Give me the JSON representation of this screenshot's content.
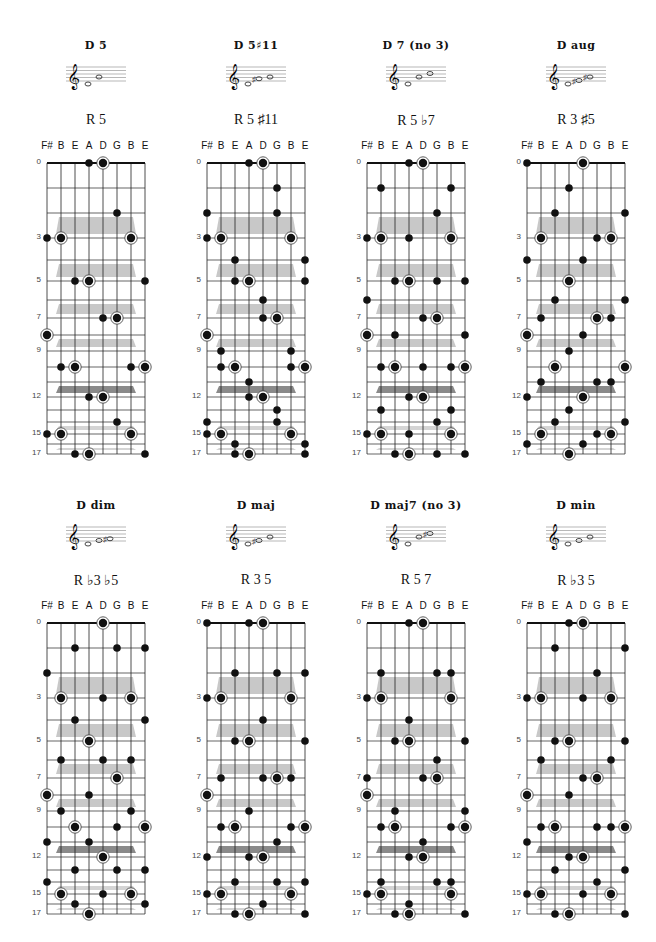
{
  "page": {
    "string_labels": [
      "F#",
      "B",
      "E",
      "A",
      "D",
      "G",
      "B",
      "E"
    ],
    "fret_labels": [
      0,
      3,
      5,
      7,
      9,
      12,
      15,
      17
    ],
    "inlay_bands": [
      {
        "between": [
          2,
          3
        ],
        "shade": "#c8c8c8"
      },
      {
        "between": [
          4,
          5
        ],
        "shade": "#c8c8c8"
      },
      {
        "between": [
          6,
          7
        ],
        "shade": "#c8c8c8"
      },
      {
        "between": [
          8,
          9
        ],
        "shade": "#c8c8c8"
      },
      {
        "between": [
          11,
          12
        ],
        "shade": "#8a8a8a"
      },
      {
        "between": [
          14,
          15
        ],
        "shade": "#d4d4d4"
      },
      {
        "between": [
          16,
          17
        ],
        "shade": "#d4d4d4"
      }
    ],
    "colors": {
      "dot": "#111111",
      "grid": "#222222",
      "nut": "#111111"
    }
  },
  "charts": [
    {
      "title": "D 5",
      "formula": "R 5",
      "staff_notes": [
        "D",
        "A"
      ],
      "dots": [
        [
          3,
          0,
          0
        ],
        [
          4,
          0,
          1
        ],
        [
          5,
          2,
          0
        ],
        [
          0,
          3,
          0
        ],
        [
          1,
          3,
          1
        ],
        [
          6,
          3,
          1
        ],
        [
          2,
          5,
          0
        ],
        [
          3,
          5,
          1
        ],
        [
          7,
          5,
          0
        ],
        [
          4,
          7,
          0
        ],
        [
          5,
          7,
          1
        ],
        [
          0,
          8,
          1
        ],
        [
          1,
          10,
          0
        ],
        [
          2,
          10,
          1
        ],
        [
          6,
          10,
          0
        ],
        [
          7,
          10,
          1
        ],
        [
          3,
          12,
          0
        ],
        [
          4,
          12,
          1
        ],
        [
          5,
          14,
          0
        ],
        [
          0,
          15,
          0
        ],
        [
          1,
          15,
          1
        ],
        [
          6,
          15,
          1
        ],
        [
          2,
          17,
          0
        ],
        [
          3,
          17,
          1
        ],
        [
          7,
          17,
          0
        ]
      ]
    },
    {
      "title": "D 5♯11",
      "formula": "R 5 ♯11",
      "staff_notes": [
        "D",
        "G#",
        "A"
      ],
      "dots": [
        [
          3,
          0,
          0
        ],
        [
          4,
          0,
          1
        ],
        [
          5,
          1,
          0
        ],
        [
          0,
          2,
          0
        ],
        [
          5,
          2,
          0
        ],
        [
          0,
          3,
          0
        ],
        [
          1,
          3,
          1
        ],
        [
          6,
          3,
          1
        ],
        [
          2,
          4,
          0
        ],
        [
          7,
          4,
          0
        ],
        [
          2,
          5,
          0
        ],
        [
          3,
          5,
          1
        ],
        [
          7,
          5,
          0
        ],
        [
          4,
          6,
          0
        ],
        [
          4,
          7,
          0
        ],
        [
          5,
          7,
          1
        ],
        [
          0,
          8,
          1
        ],
        [
          1,
          9,
          0
        ],
        [
          6,
          9,
          0
        ],
        [
          1,
          10,
          0
        ],
        [
          2,
          10,
          1
        ],
        [
          6,
          10,
          0
        ],
        [
          7,
          10,
          1
        ],
        [
          3,
          11,
          0
        ],
        [
          3,
          12,
          0
        ],
        [
          4,
          12,
          1
        ],
        [
          5,
          13,
          0
        ],
        [
          0,
          14,
          0
        ],
        [
          5,
          14,
          0
        ],
        [
          0,
          15,
          0
        ],
        [
          1,
          15,
          1
        ],
        [
          6,
          15,
          1
        ],
        [
          2,
          16,
          0
        ],
        [
          7,
          16,
          0
        ],
        [
          2,
          17,
          0
        ],
        [
          3,
          17,
          1
        ],
        [
          7,
          17,
          0
        ]
      ]
    },
    {
      "title": "D 7 (no 3)",
      "formula": "R 5 ♭7",
      "staff_notes": [
        "D",
        "A",
        "C"
      ],
      "dots": [
        [
          3,
          0,
          0
        ],
        [
          4,
          0,
          1
        ],
        [
          1,
          1,
          0
        ],
        [
          6,
          1,
          0
        ],
        [
          5,
          2,
          0
        ],
        [
          0,
          3,
          0
        ],
        [
          1,
          3,
          1
        ],
        [
          3,
          3,
          0
        ],
        [
          6,
          3,
          1
        ],
        [
          2,
          5,
          0
        ],
        [
          3,
          5,
          1
        ],
        [
          5,
          5,
          0
        ],
        [
          7,
          5,
          0
        ],
        [
          0,
          6,
          0
        ],
        [
          4,
          7,
          0
        ],
        [
          5,
          7,
          1
        ],
        [
          0,
          8,
          1
        ],
        [
          2,
          8,
          0
        ],
        [
          7,
          8,
          0
        ],
        [
          1,
          10,
          0
        ],
        [
          2,
          10,
          1
        ],
        [
          4,
          10,
          0
        ],
        [
          6,
          10,
          0
        ],
        [
          7,
          10,
          1
        ],
        [
          3,
          12,
          0
        ],
        [
          4,
          12,
          1
        ],
        [
          1,
          13,
          0
        ],
        [
          6,
          13,
          0
        ],
        [
          5,
          14,
          0
        ],
        [
          0,
          15,
          0
        ],
        [
          1,
          15,
          1
        ],
        [
          3,
          15,
          0
        ],
        [
          6,
          15,
          1
        ],
        [
          2,
          17,
          0
        ],
        [
          3,
          17,
          1
        ],
        [
          5,
          17,
          0
        ],
        [
          7,
          17,
          0
        ]
      ]
    },
    {
      "title": "D aug",
      "formula": "R 3 ♯5",
      "staff_notes": [
        "D",
        "F#",
        "A#"
      ],
      "dots": [
        [
          0,
          0,
          0
        ],
        [
          4,
          0,
          1
        ],
        [
          3,
          1,
          0
        ],
        [
          2,
          2,
          0
        ],
        [
          7,
          2,
          0
        ],
        [
          1,
          3,
          1
        ],
        [
          5,
          3,
          0
        ],
        [
          6,
          3,
          1
        ],
        [
          0,
          4,
          0
        ],
        [
          4,
          4,
          0
        ],
        [
          3,
          5,
          1
        ],
        [
          2,
          6,
          0
        ],
        [
          7,
          6,
          0
        ],
        [
          1,
          7,
          0
        ],
        [
          5,
          7,
          1
        ],
        [
          6,
          7,
          0
        ],
        [
          0,
          8,
          1
        ],
        [
          4,
          8,
          0
        ],
        [
          3,
          9,
          0
        ],
        [
          2,
          10,
          1
        ],
        [
          7,
          10,
          1
        ],
        [
          1,
          11,
          0
        ],
        [
          5,
          11,
          0
        ],
        [
          6,
          11,
          0
        ],
        [
          0,
          12,
          0
        ],
        [
          4,
          12,
          1
        ],
        [
          3,
          13,
          0
        ],
        [
          2,
          14,
          0
        ],
        [
          7,
          14,
          0
        ],
        [
          1,
          15,
          1
        ],
        [
          5,
          15,
          0
        ],
        [
          6,
          15,
          1
        ],
        [
          0,
          16,
          0
        ],
        [
          4,
          16,
          0
        ],
        [
          3,
          17,
          1
        ]
      ]
    },
    {
      "title": "D dim",
      "formula": "R ♭3 ♭5",
      "staff_notes": [
        "D",
        "F",
        "G#"
      ],
      "dots": [
        [
          4,
          0,
          1
        ],
        [
          2,
          1,
          0
        ],
        [
          5,
          1,
          0
        ],
        [
          7,
          1,
          0
        ],
        [
          0,
          2,
          0
        ],
        [
          1,
          3,
          1
        ],
        [
          4,
          3,
          0
        ],
        [
          6,
          3,
          1
        ],
        [
          2,
          4,
          0
        ],
        [
          7,
          4,
          0
        ],
        [
          3,
          5,
          1
        ],
        [
          1,
          6,
          0
        ],
        [
          4,
          6,
          0
        ],
        [
          6,
          6,
          0
        ],
        [
          5,
          7,
          1
        ],
        [
          0,
          8,
          1
        ],
        [
          3,
          8,
          0
        ],
        [
          1,
          9,
          0
        ],
        [
          6,
          9,
          0
        ],
        [
          2,
          10,
          1
        ],
        [
          5,
          10,
          0
        ],
        [
          7,
          10,
          1
        ],
        [
          0,
          11,
          0
        ],
        [
          3,
          11,
          0
        ],
        [
          4,
          12,
          1
        ],
        [
          2,
          13,
          0
        ],
        [
          5,
          13,
          0
        ],
        [
          7,
          13,
          0
        ],
        [
          0,
          14,
          0
        ],
        [
          1,
          15,
          1
        ],
        [
          4,
          15,
          0
        ],
        [
          6,
          15,
          1
        ],
        [
          2,
          16,
          0
        ],
        [
          7,
          16,
          0
        ],
        [
          3,
          17,
          1
        ]
      ]
    },
    {
      "title": "D maj",
      "formula": "R 3 5",
      "staff_notes": [
        "D",
        "F#",
        "A"
      ],
      "dots": [
        [
          0,
          0,
          0
        ],
        [
          3,
          0,
          0
        ],
        [
          4,
          0,
          1
        ],
        [
          2,
          2,
          0
        ],
        [
          5,
          2,
          0
        ],
        [
          7,
          2,
          0
        ],
        [
          0,
          3,
          0
        ],
        [
          1,
          3,
          1
        ],
        [
          6,
          3,
          1
        ],
        [
          4,
          4,
          0
        ],
        [
          2,
          5,
          0
        ],
        [
          3,
          5,
          1
        ],
        [
          7,
          5,
          0
        ],
        [
          1,
          7,
          0
        ],
        [
          4,
          7,
          0
        ],
        [
          5,
          7,
          1
        ],
        [
          6,
          7,
          0
        ],
        [
          0,
          8,
          1
        ],
        [
          3,
          9,
          0
        ],
        [
          1,
          10,
          0
        ],
        [
          2,
          10,
          1
        ],
        [
          6,
          10,
          0
        ],
        [
          7,
          10,
          1
        ],
        [
          5,
          11,
          0
        ],
        [
          0,
          12,
          0
        ],
        [
          3,
          12,
          0
        ],
        [
          4,
          12,
          1
        ],
        [
          2,
          14,
          0
        ],
        [
          5,
          14,
          0
        ],
        [
          7,
          14,
          0
        ],
        [
          0,
          15,
          0
        ],
        [
          1,
          15,
          1
        ],
        [
          6,
          15,
          1
        ],
        [
          4,
          16,
          0
        ],
        [
          2,
          17,
          0
        ],
        [
          3,
          17,
          1
        ],
        [
          7,
          17,
          0
        ]
      ]
    },
    {
      "title": "D maj7 (no 3)",
      "formula": "R 5 7",
      "staff_notes": [
        "D",
        "A",
        "C#"
      ],
      "dots": [
        [
          3,
          0,
          0
        ],
        [
          4,
          0,
          1
        ],
        [
          1,
          2,
          0
        ],
        [
          5,
          2,
          0
        ],
        [
          6,
          2,
          0
        ],
        [
          0,
          3,
          0
        ],
        [
          1,
          3,
          1
        ],
        [
          6,
          3,
          1
        ],
        [
          3,
          4,
          0
        ],
        [
          2,
          5,
          0
        ],
        [
          3,
          5,
          1
        ],
        [
          7,
          5,
          0
        ],
        [
          5,
          6,
          0
        ],
        [
          0,
          7,
          0
        ],
        [
          4,
          7,
          0
        ],
        [
          5,
          7,
          1
        ],
        [
          0,
          8,
          1
        ],
        [
          2,
          9,
          0
        ],
        [
          7,
          9,
          0
        ],
        [
          1,
          10,
          0
        ],
        [
          2,
          10,
          1
        ],
        [
          6,
          10,
          0
        ],
        [
          7,
          10,
          1
        ],
        [
          4,
          11,
          0
        ],
        [
          3,
          12,
          0
        ],
        [
          4,
          12,
          1
        ],
        [
          1,
          14,
          0
        ],
        [
          5,
          14,
          0
        ],
        [
          6,
          14,
          0
        ],
        [
          0,
          15,
          0
        ],
        [
          1,
          15,
          1
        ],
        [
          6,
          15,
          1
        ],
        [
          3,
          16,
          0
        ],
        [
          2,
          17,
          0
        ],
        [
          3,
          17,
          1
        ],
        [
          7,
          17,
          0
        ]
      ]
    },
    {
      "title": "D min",
      "formula": "R ♭3 5",
      "staff_notes": [
        "D",
        "F",
        "A"
      ],
      "dots": [
        [
          3,
          0,
          0
        ],
        [
          4,
          0,
          1
        ],
        [
          2,
          1,
          0
        ],
        [
          7,
          1,
          0
        ],
        [
          5,
          2,
          0
        ],
        [
          0,
          3,
          0
        ],
        [
          1,
          3,
          1
        ],
        [
          4,
          3,
          0
        ],
        [
          6,
          3,
          1
        ],
        [
          2,
          5,
          0
        ],
        [
          3,
          5,
          1
        ],
        [
          7,
          5,
          0
        ],
        [
          1,
          6,
          0
        ],
        [
          6,
          6,
          0
        ],
        [
          4,
          7,
          0
        ],
        [
          5,
          7,
          1
        ],
        [
          0,
          8,
          1
        ],
        [
          3,
          8,
          0
        ],
        [
          1,
          10,
          0
        ],
        [
          2,
          10,
          1
        ],
        [
          5,
          10,
          0
        ],
        [
          6,
          10,
          0
        ],
        [
          7,
          10,
          1
        ],
        [
          0,
          11,
          0
        ],
        [
          3,
          12,
          0
        ],
        [
          4,
          12,
          1
        ],
        [
          2,
          13,
          0
        ],
        [
          7,
          13,
          0
        ],
        [
          5,
          14,
          0
        ],
        [
          0,
          15,
          0
        ],
        [
          1,
          15,
          1
        ],
        [
          4,
          15,
          0
        ],
        [
          6,
          15,
          1
        ],
        [
          2,
          17,
          0
        ],
        [
          3,
          17,
          1
        ],
        [
          7,
          17,
          0
        ]
      ]
    }
  ]
}
